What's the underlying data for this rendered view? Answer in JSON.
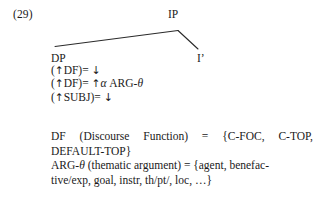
{
  "figure": {
    "example_number": "(29)",
    "tree": {
      "root_label": "IP",
      "left_daughter_label": "DP",
      "right_daughter_label": "I’",
      "annotations": [
        "(↑DF)= ↓",
        "(↑DF)= ↑α ARG-θ",
        "(↑SUBJ)= ↓"
      ],
      "annotation_parts": {
        "line1_open": "(",
        "line1_up": "↑",
        "line1_feature": "DF",
        "line1_eq": ")= ",
        "line1_down": "↓",
        "line2_open": "(",
        "line2_up": "↑",
        "line2_feature": "DF",
        "line2_eq": ")= ",
        "line2_up2": "↑",
        "line2_alpha": "α",
        "line2_tail": " ARG-",
        "line2_theta": "θ",
        "line3_open": "(",
        "line3_up": "↑",
        "line3_feature": "SUBJ",
        "line3_eq": ")= ",
        "line3_down": "↓"
      }
    },
    "definitions": {
      "df_line1": "DF (Discourse Function) = {C-FOC, C-TOP,",
      "df_line2": "DEFAULT-TOP}",
      "arg_prefix": "ARG-",
      "arg_theta": "θ",
      "arg_line1_rest": " (thematic argument) = {agent, benefac-",
      "arg_line2": "tive/exp, goal, instr, th/pt/, loc, …}"
    }
  },
  "colors": {
    "background": "#ffffff",
    "text": "#1a1a1a",
    "tree_line": "#2a2a2a"
  }
}
